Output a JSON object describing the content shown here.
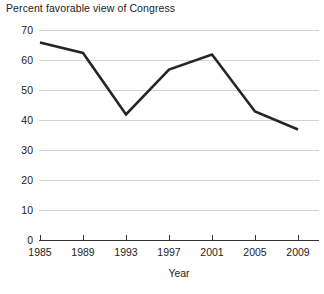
{
  "chart_data": {
    "type": "line",
    "title": "Percent favorable view of Congress",
    "xlabel": "Year",
    "ylabel": "",
    "categories": [
      "1985",
      "1989",
      "1993",
      "1997",
      "2001",
      "2005",
      "2009"
    ],
    "x": [
      1985,
      1989,
      1993,
      1997,
      2001,
      2005,
      2009
    ],
    "values": [
      66,
      62.5,
      42,
      57,
      62,
      43,
      37
    ],
    "series": [
      {
        "name": "Percent favorable view of Congress",
        "values": [
          66,
          62.5,
          42,
          57,
          62,
          43,
          37
        ]
      }
    ],
    "ylim": [
      0,
      70
    ],
    "yticks": [
      0,
      10,
      20,
      30,
      40,
      50,
      60,
      70
    ],
    "ytick_labels": [
      "0",
      "10",
      "20",
      "30",
      "40",
      "50",
      "60",
      "70"
    ],
    "xtick_labels": [
      "1985",
      "1989",
      "1993",
      "1997",
      "2001",
      "2005",
      "2009"
    ],
    "grid": true,
    "grid_axis": "y",
    "legend": false,
    "legend_position": "none",
    "line_color": "#262626",
    "grid_color": "#c9c9c9",
    "axis_color": "#333333",
    "background": "#ffffff"
  },
  "axis": {
    "x_title": "Year"
  }
}
